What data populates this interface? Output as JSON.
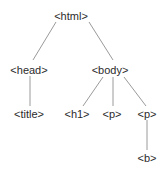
{
  "diagram": {
    "type": "tree",
    "colors": {
      "background": "#ffffff",
      "text": "#2b2b2b",
      "edge": "#9a9a9a"
    },
    "nodes": [
      {
        "id": "html",
        "label": "<html>",
        "x": 71,
        "y": 16
      },
      {
        "id": "head",
        "label": "<head>",
        "x": 29,
        "y": 70
      },
      {
        "id": "body",
        "label": "<body>",
        "x": 110,
        "y": 70
      },
      {
        "id": "title",
        "label": "<title>",
        "x": 29,
        "y": 114
      },
      {
        "id": "h1",
        "label": "<h1>",
        "x": 77,
        "y": 114
      },
      {
        "id": "p1",
        "label": "<p>",
        "x": 112,
        "y": 114
      },
      {
        "id": "p2",
        "label": "<p>",
        "x": 147,
        "y": 114
      },
      {
        "id": "b",
        "label": "<b>",
        "x": 147,
        "y": 158
      }
    ],
    "edges": [
      {
        "from": "html",
        "to": "head",
        "x1": 56,
        "y1": 22,
        "x2": 33,
        "y2": 60
      },
      {
        "from": "html",
        "to": "body",
        "x1": 89,
        "y1": 22,
        "x2": 113,
        "y2": 60
      },
      {
        "from": "head",
        "to": "title",
        "x1": 30,
        "y1": 76,
        "x2": 30,
        "y2": 106
      },
      {
        "from": "body",
        "to": "h1",
        "x1": 103,
        "y1": 77,
        "x2": 83,
        "y2": 106
      },
      {
        "from": "body",
        "to": "p1",
        "x1": 113,
        "y1": 77,
        "x2": 113,
        "y2": 106
      },
      {
        "from": "body",
        "to": "p2",
        "x1": 124,
        "y1": 77,
        "x2": 146,
        "y2": 106
      },
      {
        "from": "p2",
        "to": "b",
        "x1": 147,
        "y1": 120,
        "x2": 147,
        "y2": 150
      }
    ]
  }
}
